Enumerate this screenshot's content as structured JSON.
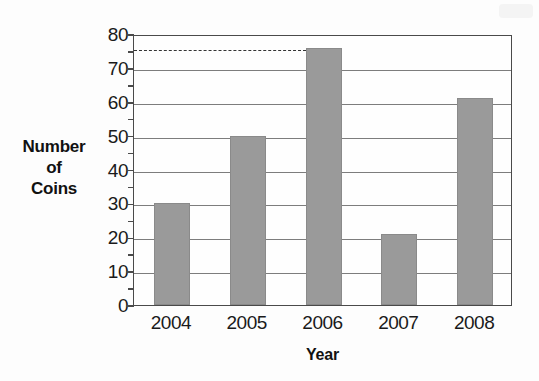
{
  "chart_data": {
    "type": "bar",
    "title": "",
    "xlabel": "Year",
    "ylabel": "Number of Coins",
    "ylabel_lines": [
      "Number",
      "of",
      "Coins"
    ],
    "categories": [
      "2004",
      "2005",
      "2006",
      "2007",
      "2008"
    ],
    "values": [
      30,
      50,
      76,
      21,
      61
    ],
    "series": [
      {
        "name": "Number of Coins",
        "values": [
          30,
          50,
          76,
          21,
          61
        ]
      }
    ],
    "ylim": [
      0,
      80
    ],
    "xlim_categories": 5,
    "y_major_ticks": [
      0,
      10,
      20,
      30,
      40,
      50,
      60,
      70,
      80
    ],
    "y_minor_ticks": [
      5,
      15,
      25,
      35,
      45,
      55,
      65,
      75
    ],
    "y_tick_labels": [
      "0",
      "10",
      "20",
      "30",
      "40",
      "50",
      "60",
      "70",
      "80"
    ],
    "grid": true,
    "grid_axis": "y",
    "legend": false,
    "legend_position": "none",
    "bar_color": "#9a9a9a",
    "grid_color": "#7d7d7d",
    "frame_color": "#4a4a4a",
    "background_color": "#fdfdfd",
    "annotations": [
      {
        "kind": "reference-line",
        "style": "dashed",
        "value": 76,
        "label": "",
        "from_category": "2004",
        "to_category": "2006",
        "color": "#333333"
      }
    ]
  }
}
